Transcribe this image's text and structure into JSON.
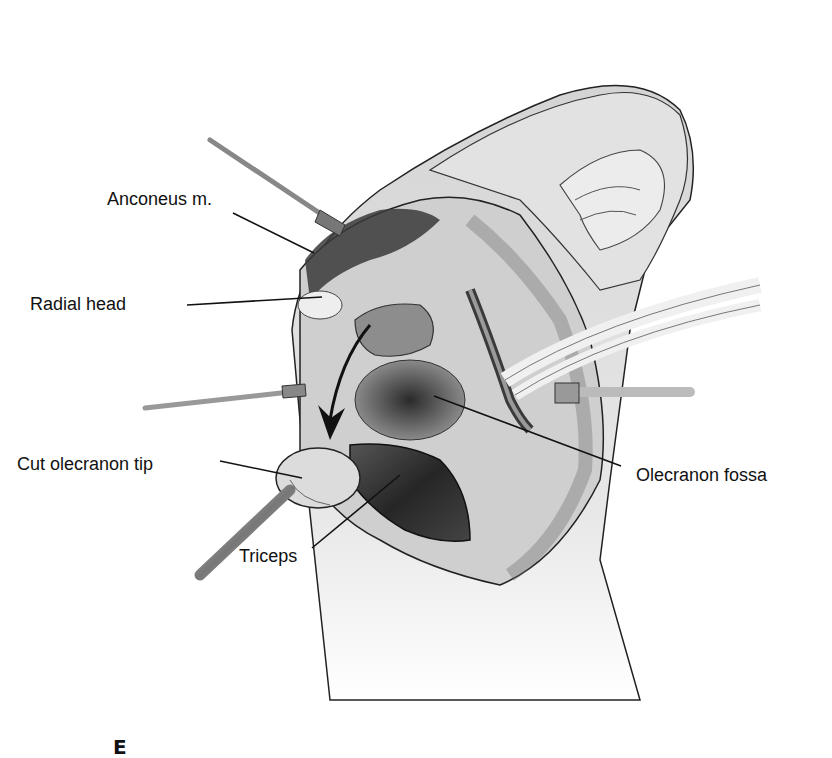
{
  "figure": {
    "panel_letter": "E",
    "labels": {
      "anconeus": "Anconeus m.",
      "radial_head": "Radial head",
      "cut_olecranon_tip": "Cut olecranon tip",
      "triceps": "Triceps",
      "olecranon_fossa": "Olecranon fossa"
    },
    "colors": {
      "background": "#ffffff",
      "line": "#111111",
      "skin_light": "#e6e6e6",
      "skin_mid": "#c9c9c9",
      "tissue_dark": "#4a4a4a",
      "muscle_dark": "#2e2e2e"
    }
  }
}
